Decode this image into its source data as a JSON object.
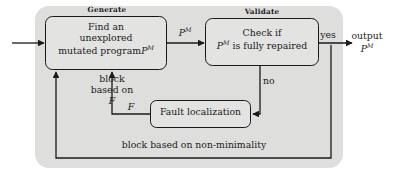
{
  "figure": {
    "type": "flowchart",
    "title": "",
    "background_panel_color": "#dededd",
    "node_fill_color": "#e3e3e2",
    "stroke_color": "#1a1a1a",
    "text_color": "#1a1a1a"
  },
  "phases": [
    {
      "id": "generate",
      "label": "Generate"
    },
    {
      "id": "validate",
      "label": "Validate"
    }
  ],
  "nodes": [
    {
      "id": "find-program",
      "lines": [
        "Find an",
        "unexplored",
        "mutated program"
      ],
      "trailing_symbol": "P",
      "trailing_superscript": "M",
      "line1": "Find an",
      "line2": "unexplored",
      "line3": "mutated program"
    },
    {
      "id": "check-repaired",
      "line1": "Check if",
      "line2_prefix": "P",
      "line2_superscript": "M",
      "line2_suffix": "is fully repaired"
    },
    {
      "id": "fault-localization",
      "label": "Fault localization"
    }
  ],
  "edges": [
    {
      "id": "input-edge",
      "label": ""
    },
    {
      "id": "program-edge",
      "label_symbol": "P",
      "label_superscript": "M"
    },
    {
      "id": "yes-edge",
      "label": "yes"
    },
    {
      "id": "output-edge",
      "label_line1": "output",
      "label_symbol": "P",
      "label_superscript": "M"
    },
    {
      "id": "no-edge",
      "label": "no"
    },
    {
      "id": "block-f-edge",
      "label_line1": "block",
      "label_line2": "based on",
      "label_symbol": "F"
    },
    {
      "id": "fault-to-generate-edge",
      "label_symbol": "F"
    },
    {
      "id": "non-minimality-edge",
      "label": "block based on non-minimality"
    }
  ]
}
